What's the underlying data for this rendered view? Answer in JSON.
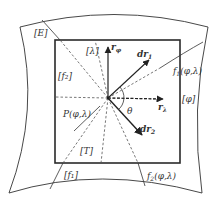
{
  "figure": {
    "colors": {
      "line": "#333333",
      "square": "#2a2a2a",
      "dashed": "#555555",
      "background": "#ffffff"
    },
    "point": {
      "label": "P(φ,λ)"
    },
    "regions": {
      "E": "[E]",
      "lambda": "[λ]",
      "f2": "[f₂]",
      "phi": "[φ]",
      "T": "[T]",
      "f1": "[f₁]"
    },
    "vectors": {
      "r_phi": {
        "base": "r",
        "sub": "φ"
      },
      "r_lambda": {
        "base": "r",
        "sub": "λ"
      },
      "dr1": {
        "base": "dr",
        "sub": "1"
      },
      "dr2": {
        "base": "dr",
        "sub": "2"
      }
    },
    "angle": "θ",
    "curves": {
      "f1": {
        "base": "f",
        "sub": "1",
        "args": "(φ,λ)"
      },
      "f2": {
        "base": "f",
        "sub": "2",
        "args": "(φ,λ)"
      }
    }
  }
}
